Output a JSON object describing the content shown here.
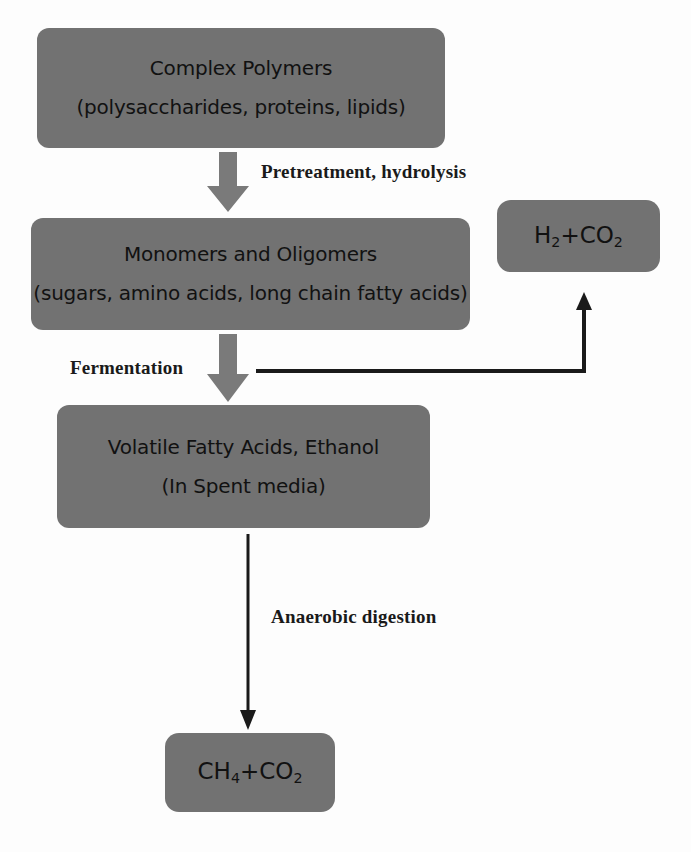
{
  "diagram": {
    "background_color": "#fdfdfd",
    "box_fill_color": "#727272",
    "text_color": "#111111",
    "arrow_color": "#7a7a7a",
    "line_color": "#1a1a1a"
  },
  "nodes": {
    "complex_polymers": {
      "line1": "Complex Polymers",
      "line2": "(polysaccharides, proteins, lipids)"
    },
    "monomers": {
      "line1": "Monomers and Oligomers",
      "line2": "(sugars, amino acids, long chain fatty acids)"
    },
    "hydrogen_carbon_dioxide": {
      "formula_main_1": "H",
      "formula_sub_1": "2",
      "formula_plus": "+CO",
      "formula_sub_2": "2",
      "plain": "H2+CO2"
    },
    "volatile_fatty_acids": {
      "line1": "Volatile Fatty Acids, Ethanol",
      "line2": "(In Spent media)"
    },
    "methane_carbon_dioxide": {
      "formula_main_1": "CH",
      "formula_sub_1": "4",
      "formula_plus": "+CO",
      "formula_sub_2": "2",
      "plain": "CH4+CO2"
    }
  },
  "edges": {
    "pretreatment": {
      "label": "Pretreatment, hydrolysis",
      "from": "complex_polymers",
      "to": "monomers",
      "style": "block-arrow-down"
    },
    "fermentation": {
      "label": "Fermentation",
      "from": "monomers",
      "to": "volatile_fatty_acids",
      "style": "block-arrow-down"
    },
    "gas_branch": {
      "label": "",
      "from": "fermentation",
      "to": "hydrogen_carbon_dioxide",
      "style": "elbow-line-arrow-up"
    },
    "anaerobic_digestion": {
      "label": "Anaerobic digestion",
      "from": "volatile_fatty_acids",
      "to": "methane_carbon_dioxide",
      "style": "thin-line-arrow-down"
    }
  }
}
